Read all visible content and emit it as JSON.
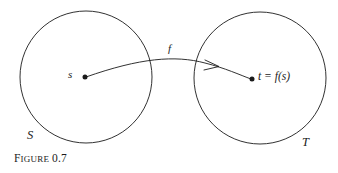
{
  "figure": {
    "caption_prefix_first_letter": "F",
    "caption_prefix_rest": "IGURE",
    "caption_number": "0.7",
    "caption_full": "FIGURE 0.7",
    "stroke_color": "#1b1b1b",
    "background_color": "#ffffff"
  },
  "diagram": {
    "domain_circle": {
      "label": "S",
      "center_x": 86,
      "center_y": 77,
      "radius": 66
    },
    "codomain_circle": {
      "label": "T",
      "center_x": 260,
      "center_y": 78,
      "radius": 66
    },
    "source_point": {
      "label": "s",
      "x": 85,
      "y": 77
    },
    "target_point": {
      "label": "t = f(s)",
      "x": 252,
      "y": 79
    },
    "mapping_arrow": {
      "label": "f",
      "arrowhead_x": 215,
      "arrowhead_y": 67
    }
  }
}
